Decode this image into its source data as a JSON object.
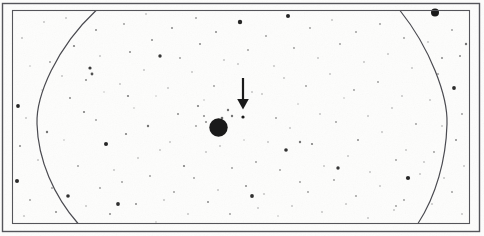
{
  "figure": {
    "kind": "astronomical-photographic-plate",
    "background_color": "#fdfdfc",
    "ink_color": "#1a1a1a",
    "frame_line_color": "#55555a",
    "arc_line_color": "#4a4a50"
  },
  "frame": {
    "outer": {
      "x": 2.5,
      "y": 3.5,
      "width": 477,
      "height": 228,
      "stroke_width": 1.4
    },
    "inner": {
      "x": 12.5,
      "y": 10.5,
      "width": 457,
      "height": 213,
      "stroke_width": 1.1
    }
  },
  "arcs": [
    {
      "name": "left-plate-arc",
      "path": "M 96 10.5 C 56 48, 36 96, 37 124 C 38 160, 54 196, 78 223.5",
      "stroke_width": 1.2
    },
    {
      "name": "right-plate-arc",
      "path": "M 400 10.5 C 430 48, 448 96, 447 124 C 446 160, 436 196, 418 223.5",
      "stroke_width": 1.2
    }
  ],
  "marker_arrow": {
    "name": "pointer-arrow",
    "shaft_x": 243,
    "shaft_top_y": 78,
    "shaft_bottom_y": 101,
    "shaft_width": 2.2,
    "head_points": "237.2,99 248.8,99 243,109.5",
    "points_to": {
      "x": 243,
      "y": 117
    }
  },
  "primary_object": {
    "name": "bright-star",
    "cx": 218.5,
    "cy": 127.5,
    "r": 9.2
  },
  "secondary_object": {
    "name": "target-star",
    "cx": 243,
    "cy": 117,
    "r": 1.6
  },
  "notable_object": {
    "name": "upper-right-star",
    "cx": 435,
    "cy": 12.5,
    "r": 4.0
  },
  "stars": [
    {
      "x": 22,
      "y": 38,
      "r": 0.8,
      "o": 0.45
    },
    {
      "x": 30,
      "y": 66,
      "r": 0.7,
      "o": 0.35
    },
    {
      "x": 18,
      "y": 106,
      "r": 1.9,
      "o": 0.95
    },
    {
      "x": 26,
      "y": 118,
      "r": 0.8,
      "o": 0.4
    },
    {
      "x": 20,
      "y": 146,
      "r": 1.0,
      "o": 0.5
    },
    {
      "x": 17,
      "y": 181,
      "r": 2.0,
      "o": 0.92
    },
    {
      "x": 30,
      "y": 200,
      "r": 0.9,
      "o": 0.45
    },
    {
      "x": 24,
      "y": 216,
      "r": 0.8,
      "o": 0.4
    },
    {
      "x": 44,
      "y": 22,
      "r": 0.8,
      "o": 0.4
    },
    {
      "x": 50,
      "y": 62,
      "r": 0.9,
      "o": 0.45
    },
    {
      "x": 42,
      "y": 90,
      "r": 0.7,
      "o": 0.3
    },
    {
      "x": 47,
      "y": 132,
      "r": 1.2,
      "o": 0.6
    },
    {
      "x": 38,
      "y": 160,
      "r": 0.8,
      "o": 0.4
    },
    {
      "x": 52,
      "y": 188,
      "r": 0.9,
      "o": 0.45
    },
    {
      "x": 56,
      "y": 212,
      "r": 1.0,
      "o": 0.5
    },
    {
      "x": 66,
      "y": 18,
      "r": 0.8,
      "o": 0.4
    },
    {
      "x": 74,
      "y": 46,
      "r": 1.1,
      "o": 0.55
    },
    {
      "x": 62,
      "y": 76,
      "r": 0.8,
      "o": 0.4
    },
    {
      "x": 70,
      "y": 98,
      "r": 1.0,
      "o": 0.5
    },
    {
      "x": 84,
      "y": 112,
      "r": 1.1,
      "o": 0.55
    },
    {
      "x": 64,
      "y": 140,
      "r": 0.7,
      "o": 0.35
    },
    {
      "x": 78,
      "y": 166,
      "r": 0.9,
      "o": 0.45
    },
    {
      "x": 68,
      "y": 196,
      "r": 1.8,
      "o": 0.9
    },
    {
      "x": 86,
      "y": 206,
      "r": 0.8,
      "o": 0.4
    },
    {
      "x": 96,
      "y": 30,
      "r": 1.0,
      "o": 0.5
    },
    {
      "x": 90,
      "y": 68,
      "r": 1.6,
      "o": 0.85
    },
    {
      "x": 92,
      "y": 74,
      "r": 1.4,
      "o": 0.75
    },
    {
      "x": 86,
      "y": 80,
      "r": 1.0,
      "o": 0.5
    },
    {
      "x": 100,
      "y": 56,
      "r": 0.8,
      "o": 0.4
    },
    {
      "x": 104,
      "y": 92,
      "r": 0.7,
      "o": 0.3
    },
    {
      "x": 96,
      "y": 120,
      "r": 0.9,
      "o": 0.45
    },
    {
      "x": 106,
      "y": 144,
      "r": 2.0,
      "o": 0.95
    },
    {
      "x": 114,
      "y": 170,
      "r": 0.8,
      "o": 0.4
    },
    {
      "x": 100,
      "y": 188,
      "r": 0.9,
      "o": 0.45
    },
    {
      "x": 110,
      "y": 214,
      "r": 1.0,
      "o": 0.5
    },
    {
      "x": 124,
      "y": 24,
      "r": 0.9,
      "o": 0.45
    },
    {
      "x": 130,
      "y": 52,
      "r": 1.0,
      "o": 0.5
    },
    {
      "x": 120,
      "y": 84,
      "r": 0.8,
      "o": 0.4
    },
    {
      "x": 134,
      "y": 108,
      "r": 0.7,
      "o": 0.35
    },
    {
      "x": 126,
      "y": 134,
      "r": 1.1,
      "o": 0.55
    },
    {
      "x": 138,
      "y": 158,
      "r": 0.8,
      "o": 0.4
    },
    {
      "x": 122,
      "y": 182,
      "r": 0.9,
      "o": 0.45
    },
    {
      "x": 136,
      "y": 204,
      "r": 1.0,
      "o": 0.5
    },
    {
      "x": 146,
      "y": 14,
      "r": 0.8,
      "o": 0.4
    },
    {
      "x": 152,
      "y": 40,
      "r": 1.0,
      "o": 0.5
    },
    {
      "x": 144,
      "y": 70,
      "r": 0.8,
      "o": 0.4
    },
    {
      "x": 156,
      "y": 96,
      "r": 0.7,
      "o": 0.3
    },
    {
      "x": 148,
      "y": 126,
      "r": 1.2,
      "o": 0.6
    },
    {
      "x": 160,
      "y": 150,
      "r": 0.8,
      "o": 0.4
    },
    {
      "x": 150,
      "y": 176,
      "r": 0.9,
      "o": 0.45
    },
    {
      "x": 164,
      "y": 200,
      "r": 0.8,
      "o": 0.4
    },
    {
      "x": 156,
      "y": 222,
      "r": 0.7,
      "o": 0.35
    },
    {
      "x": 172,
      "y": 28,
      "r": 1.0,
      "o": 0.5
    },
    {
      "x": 180,
      "y": 58,
      "r": 0.9,
      "o": 0.45
    },
    {
      "x": 168,
      "y": 88,
      "r": 0.8,
      "o": 0.4
    },
    {
      "x": 178,
      "y": 114,
      "r": 1.0,
      "o": 0.5
    },
    {
      "x": 170,
      "y": 142,
      "r": 0.8,
      "o": 0.4
    },
    {
      "x": 184,
      "y": 166,
      "r": 1.1,
      "o": 0.55
    },
    {
      "x": 174,
      "y": 192,
      "r": 0.9,
      "o": 0.45
    },
    {
      "x": 188,
      "y": 214,
      "r": 0.8,
      "o": 0.4
    },
    {
      "x": 196,
      "y": 18,
      "r": 0.9,
      "o": 0.45
    },
    {
      "x": 200,
      "y": 44,
      "r": 1.0,
      "o": 0.5
    },
    {
      "x": 192,
      "y": 72,
      "r": 0.8,
      "o": 0.4
    },
    {
      "x": 204,
      "y": 100,
      "r": 0.7,
      "o": 0.35
    },
    {
      "x": 198,
      "y": 106,
      "r": 1.1,
      "o": 0.55
    },
    {
      "x": 206,
      "y": 152,
      "r": 0.8,
      "o": 0.4
    },
    {
      "x": 194,
      "y": 178,
      "r": 0.9,
      "o": 0.45
    },
    {
      "x": 208,
      "y": 202,
      "r": 1.0,
      "o": 0.5
    },
    {
      "x": 216,
      "y": 32,
      "r": 1.0,
      "o": 0.5
    },
    {
      "x": 224,
      "y": 60,
      "r": 0.8,
      "o": 0.4
    },
    {
      "x": 214,
      "y": 86,
      "r": 0.9,
      "o": 0.45
    },
    {
      "x": 228,
      "y": 110,
      "r": 1.2,
      "o": 0.6
    },
    {
      "x": 220,
      "y": 146,
      "r": 0.8,
      "o": 0.4
    },
    {
      "x": 232,
      "y": 168,
      "r": 0.9,
      "o": 0.45
    },
    {
      "x": 218,
      "y": 190,
      "r": 0.8,
      "o": 0.4
    },
    {
      "x": 230,
      "y": 214,
      "r": 0.9,
      "o": 0.45
    },
    {
      "x": 240,
      "y": 22,
      "r": 2.2,
      "o": 0.95
    },
    {
      "x": 248,
      "y": 50,
      "r": 0.9,
      "o": 0.45
    },
    {
      "x": 238,
      "y": 64,
      "r": 0.8,
      "o": 0.4
    },
    {
      "x": 252,
      "y": 92,
      "r": 0.8,
      "o": 0.4
    },
    {
      "x": 244,
      "y": 140,
      "r": 0.7,
      "o": 0.35
    },
    {
      "x": 256,
      "y": 162,
      "r": 0.9,
      "o": 0.45
    },
    {
      "x": 246,
      "y": 186,
      "r": 1.0,
      "o": 0.5
    },
    {
      "x": 258,
      "y": 208,
      "r": 0.8,
      "o": 0.4
    },
    {
      "x": 266,
      "y": 36,
      "r": 0.9,
      "o": 0.45
    },
    {
      "x": 274,
      "y": 66,
      "r": 0.8,
      "o": 0.4
    },
    {
      "x": 262,
      "y": 94,
      "r": 0.8,
      "o": 0.4
    },
    {
      "x": 276,
      "y": 118,
      "r": 0.9,
      "o": 0.45
    },
    {
      "x": 268,
      "y": 142,
      "r": 0.8,
      "o": 0.4
    },
    {
      "x": 280,
      "y": 170,
      "r": 0.9,
      "o": 0.45
    },
    {
      "x": 264,
      "y": 194,
      "r": 0.8,
      "o": 0.4
    },
    {
      "x": 278,
      "y": 216,
      "r": 0.7,
      "o": 0.35
    },
    {
      "x": 288,
      "y": 16,
      "r": 2.0,
      "o": 0.95
    },
    {
      "x": 294,
      "y": 48,
      "r": 0.9,
      "o": 0.45
    },
    {
      "x": 284,
      "y": 78,
      "r": 0.8,
      "o": 0.4
    },
    {
      "x": 298,
      "y": 104,
      "r": 0.7,
      "o": 0.35
    },
    {
      "x": 290,
      "y": 128,
      "r": 0.8,
      "o": 0.4
    },
    {
      "x": 286,
      "y": 150,
      "r": 1.8,
      "o": 0.9
    },
    {
      "x": 300,
      "y": 182,
      "r": 0.9,
      "o": 0.45
    },
    {
      "x": 292,
      "y": 206,
      "r": 0.8,
      "o": 0.4
    },
    {
      "x": 310,
      "y": 28,
      "r": 0.9,
      "o": 0.45
    },
    {
      "x": 318,
      "y": 58,
      "r": 0.8,
      "o": 0.4
    },
    {
      "x": 306,
      "y": 86,
      "r": 0.9,
      "o": 0.45
    },
    {
      "x": 320,
      "y": 114,
      "r": 0.8,
      "o": 0.4
    },
    {
      "x": 312,
      "y": 144,
      "r": 1.1,
      "o": 0.55
    },
    {
      "x": 324,
      "y": 166,
      "r": 0.8,
      "o": 0.4
    },
    {
      "x": 308,
      "y": 192,
      "r": 0.9,
      "o": 0.45
    },
    {
      "x": 322,
      "y": 212,
      "r": 0.8,
      "o": 0.4
    },
    {
      "x": 332,
      "y": 20,
      "r": 0.8,
      "o": 0.4
    },
    {
      "x": 340,
      "y": 44,
      "r": 0.9,
      "o": 0.45
    },
    {
      "x": 330,
      "y": 74,
      "r": 0.8,
      "o": 0.4
    },
    {
      "x": 344,
      "y": 98,
      "r": 0.7,
      "o": 0.35
    },
    {
      "x": 336,
      "y": 122,
      "r": 0.9,
      "o": 0.45
    },
    {
      "x": 348,
      "y": 156,
      "r": 0.8,
      "o": 0.4
    },
    {
      "x": 334,
      "y": 180,
      "r": 0.9,
      "o": 0.45
    },
    {
      "x": 346,
      "y": 204,
      "r": 0.8,
      "o": 0.4
    },
    {
      "x": 356,
      "y": 32,
      "r": 0.9,
      "o": 0.45
    },
    {
      "x": 364,
      "y": 62,
      "r": 0.8,
      "o": 0.4
    },
    {
      "x": 354,
      "y": 90,
      "r": 0.9,
      "o": 0.45
    },
    {
      "x": 368,
      "y": 116,
      "r": 0.8,
      "o": 0.4
    },
    {
      "x": 358,
      "y": 140,
      "r": 1.0,
      "o": 0.5
    },
    {
      "x": 370,
      "y": 172,
      "r": 0.8,
      "o": 0.4
    },
    {
      "x": 356,
      "y": 196,
      "r": 0.9,
      "o": 0.45
    },
    {
      "x": 368,
      "y": 218,
      "r": 0.8,
      "o": 0.4
    },
    {
      "x": 380,
      "y": 24,
      "r": 0.9,
      "o": 0.45
    },
    {
      "x": 388,
      "y": 54,
      "r": 0.8,
      "o": 0.4
    },
    {
      "x": 378,
      "y": 82,
      "r": 0.9,
      "o": 0.45
    },
    {
      "x": 392,
      "y": 108,
      "r": 0.8,
      "o": 0.4
    },
    {
      "x": 382,
      "y": 132,
      "r": 0.8,
      "o": 0.4
    },
    {
      "x": 396,
      "y": 160,
      "r": 0.9,
      "o": 0.45
    },
    {
      "x": 380,
      "y": 186,
      "r": 0.8,
      "o": 0.4
    },
    {
      "x": 394,
      "y": 210,
      "r": 0.8,
      "o": 0.4
    },
    {
      "x": 404,
      "y": 38,
      "r": 0.9,
      "o": 0.45
    },
    {
      "x": 412,
      "y": 68,
      "r": 0.8,
      "o": 0.4
    },
    {
      "x": 402,
      "y": 96,
      "r": 0.8,
      "o": 0.4
    },
    {
      "x": 416,
      "y": 124,
      "r": 0.9,
      "o": 0.45
    },
    {
      "x": 406,
      "y": 150,
      "r": 0.8,
      "o": 0.4
    },
    {
      "x": 420,
      "y": 174,
      "r": 0.8,
      "o": 0.4
    },
    {
      "x": 404,
      "y": 200,
      "r": 0.9,
      "o": 0.45
    },
    {
      "x": 428,
      "y": 42,
      "r": 0.8,
      "o": 0.4
    },
    {
      "x": 438,
      "y": 74,
      "r": 0.9,
      "o": 0.45
    },
    {
      "x": 430,
      "y": 100,
      "r": 0.8,
      "o": 0.4
    },
    {
      "x": 442,
      "y": 126,
      "r": 0.8,
      "o": 0.4
    },
    {
      "x": 434,
      "y": 152,
      "r": 0.9,
      "o": 0.45
    },
    {
      "x": 444,
      "y": 178,
      "r": 0.8,
      "o": 0.4
    },
    {
      "x": 432,
      "y": 204,
      "r": 0.8,
      "o": 0.4
    },
    {
      "x": 452,
      "y": 30,
      "r": 0.9,
      "o": 0.45
    },
    {
      "x": 460,
      "y": 56,
      "r": 1.0,
      "o": 0.5
    },
    {
      "x": 454,
      "y": 88,
      "r": 1.9,
      "o": 0.92
    },
    {
      "x": 462,
      "y": 114,
      "r": 0.9,
      "o": 0.45
    },
    {
      "x": 456,
      "y": 140,
      "r": 1.0,
      "o": 0.5
    },
    {
      "x": 464,
      "y": 166,
      "r": 0.8,
      "o": 0.4
    },
    {
      "x": 452,
      "y": 192,
      "r": 0.9,
      "o": 0.45
    },
    {
      "x": 462,
      "y": 214,
      "r": 0.8,
      "o": 0.4
    },
    {
      "x": 408,
      "y": 178,
      "r": 2.1,
      "o": 0.95
    },
    {
      "x": 396,
      "y": 206,
      "r": 0.9,
      "o": 0.45
    },
    {
      "x": 424,
      "y": 162,
      "r": 0.8,
      "o": 0.4
    },
    {
      "x": 252,
      "y": 196,
      "r": 1.9,
      "o": 0.9
    },
    {
      "x": 118,
      "y": 204,
      "r": 1.9,
      "o": 0.9
    },
    {
      "x": 160,
      "y": 56,
      "r": 1.7,
      "o": 0.88
    },
    {
      "x": 128,
      "y": 96,
      "r": 1.1,
      "o": 0.55
    },
    {
      "x": 206,
      "y": 122,
      "r": 1.0,
      "o": 0.5
    },
    {
      "x": 222,
      "y": 118,
      "r": 1.3,
      "o": 0.65
    },
    {
      "x": 232,
      "y": 116,
      "r": 1.2,
      "o": 0.6
    },
    {
      "x": 204,
      "y": 116,
      "r": 1.0,
      "o": 0.5
    },
    {
      "x": 196,
      "y": 126,
      "r": 0.9,
      "o": 0.45
    },
    {
      "x": 338,
      "y": 168,
      "r": 1.7,
      "o": 0.88
    },
    {
      "x": 300,
      "y": 142,
      "r": 1.2,
      "o": 0.6
    },
    {
      "x": 442,
      "y": 58,
      "r": 1.0,
      "o": 0.5
    },
    {
      "x": 466,
      "y": 44,
      "r": 1.2,
      "o": 0.6
    }
  ]
}
